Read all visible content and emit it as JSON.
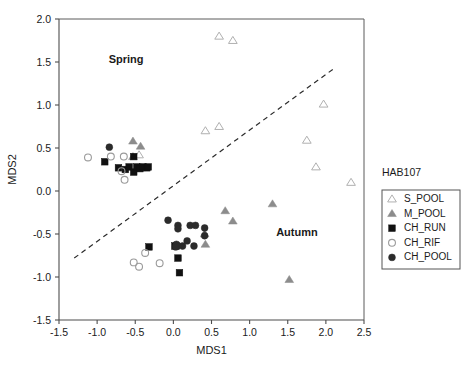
{
  "chart_data": {
    "type": "scatter",
    "title": "",
    "xlabel": "MDS1",
    "ylabel": "MDS2",
    "xlim": [
      -1.5,
      2.5
    ],
    "ylim": [
      -1.5,
      2.0
    ],
    "xticks": [
      "-1.5",
      "-1.0",
      "-0.5",
      "0.0",
      "0.5",
      "1.0",
      "1.5",
      "2.0",
      "2.5"
    ],
    "xtick_values": [
      -1.5,
      -1.0,
      -0.5,
      0.0,
      0.5,
      1.0,
      1.5,
      2.0,
      2.5
    ],
    "yticks": [
      "2.0",
      "1.5",
      "1.0",
      "0.5",
      "0.0",
      "-0.5",
      "-1.0",
      "-1.5"
    ],
    "ytick_values": [
      2.0,
      1.5,
      1.0,
      0.5,
      0.0,
      -0.5,
      -1.0,
      -1.5
    ],
    "grid": false,
    "legend_position": "right-outside",
    "legend_title": "HAB107",
    "annotations": [
      {
        "text": "Spring",
        "x": -0.62,
        "y": 1.49,
        "bold": true
      },
      {
        "text": "Autumn",
        "x": 1.62,
        "y": -0.52,
        "bold": true
      }
    ],
    "reference_line": {
      "type": "dashed",
      "x0": -1.3,
      "y0": -0.78,
      "x1": 2.1,
      "y1": 1.42
    },
    "series": [
      {
        "name": "S_POOL",
        "marker": "triangle-open",
        "color": "#b0b0b0",
        "fill": "none",
        "points": [
          [
            0.6,
            1.8
          ],
          [
            0.78,
            1.75
          ],
          [
            0.42,
            0.7
          ],
          [
            0.6,
            0.75
          ],
          [
            1.97,
            1.01
          ],
          [
            1.75,
            0.59
          ],
          [
            1.87,
            0.28
          ],
          [
            2.33,
            0.1
          ],
          [
            -0.45,
            0.42
          ]
        ]
      },
      {
        "name": "M_POOL",
        "marker": "triangle-filled",
        "color": "#8c8c8c",
        "fill": "#8c8c8c",
        "points": [
          [
            -0.53,
            0.58
          ],
          [
            -0.43,
            0.52
          ],
          [
            -0.53,
            0.4
          ],
          [
            -0.42,
            0.27
          ],
          [
            0.68,
            -0.23
          ],
          [
            0.78,
            -0.35
          ],
          [
            1.3,
            -0.15
          ],
          [
            1.52,
            -1.03
          ],
          [
            0.42,
            -0.62
          ],
          [
            0.41,
            -0.5
          ]
        ]
      },
      {
        "name": "CH_RUN",
        "marker": "square-filled",
        "color": "#111111",
        "fill": "#111111",
        "points": [
          [
            -0.9,
            0.34
          ],
          [
            -0.72,
            0.27
          ],
          [
            -0.63,
            0.25
          ],
          [
            -0.58,
            0.28
          ],
          [
            -0.52,
            0.22
          ],
          [
            -0.48,
            0.28
          ],
          [
            -0.52,
            0.4
          ],
          [
            -0.44,
            0.26
          ],
          [
            -0.4,
            0.28
          ],
          [
            -0.35,
            0.27
          ],
          [
            -0.33,
            0.28
          ],
          [
            -0.32,
            -0.65
          ],
          [
            0.02,
            -0.64
          ],
          [
            0.06,
            -0.78
          ],
          [
            0.08,
            -0.95
          ],
          [
            0.04,
            -0.64
          ]
        ]
      },
      {
        "name": "CH_RIF",
        "marker": "circle-open",
        "color": "#9a9a9a",
        "fill": "none",
        "points": [
          [
            -1.12,
            0.39
          ],
          [
            -0.82,
            0.4
          ],
          [
            -0.65,
            0.4
          ],
          [
            -0.68,
            0.23
          ],
          [
            -0.64,
            0.13
          ],
          [
            -0.37,
            -0.72
          ],
          [
            -0.52,
            -0.83
          ],
          [
            -0.45,
            -0.88
          ],
          [
            -0.18,
            -0.84
          ]
        ]
      },
      {
        "name": "CH_POOL",
        "marker": "circle-filled",
        "color": "#2b2b2b",
        "fill": "#2b2b2b",
        "points": [
          [
            -0.84,
            0.51
          ],
          [
            -0.07,
            -0.34
          ],
          [
            0.06,
            -0.4
          ],
          [
            0.06,
            -0.44
          ],
          [
            0.22,
            -0.4
          ],
          [
            0.29,
            -0.4
          ],
          [
            0.41,
            -0.43
          ],
          [
            0.18,
            -0.58
          ],
          [
            0.12,
            -0.64
          ],
          [
            0.27,
            -0.64
          ],
          [
            0.04,
            -0.62
          ],
          [
            0.41,
            -0.52
          ],
          [
            0.03,
            -0.65
          ]
        ]
      }
    ]
  },
  "axes": {
    "x_title": "MDS1",
    "y_title": "MDS2"
  },
  "legend": {
    "title": "HAB107",
    "entries": [
      {
        "label": "S_POOL",
        "marker": "triangle-open"
      },
      {
        "label": "M_POOL",
        "marker": "triangle-filled"
      },
      {
        "label": "CH_RUN",
        "marker": "square-filled"
      },
      {
        "label": "CH_RIF",
        "marker": "circle-open"
      },
      {
        "label": "CH_POOL",
        "marker": "circle-filled"
      }
    ]
  },
  "colors": {
    "s_pool": "#b0b0b0",
    "m_pool": "#8c8c8c",
    "ch_run": "#111111",
    "ch_rif": "#9a9a9a",
    "ch_pool": "#2b2b2b",
    "axis": "#4d4d4d",
    "text": "#1a1a1a"
  }
}
